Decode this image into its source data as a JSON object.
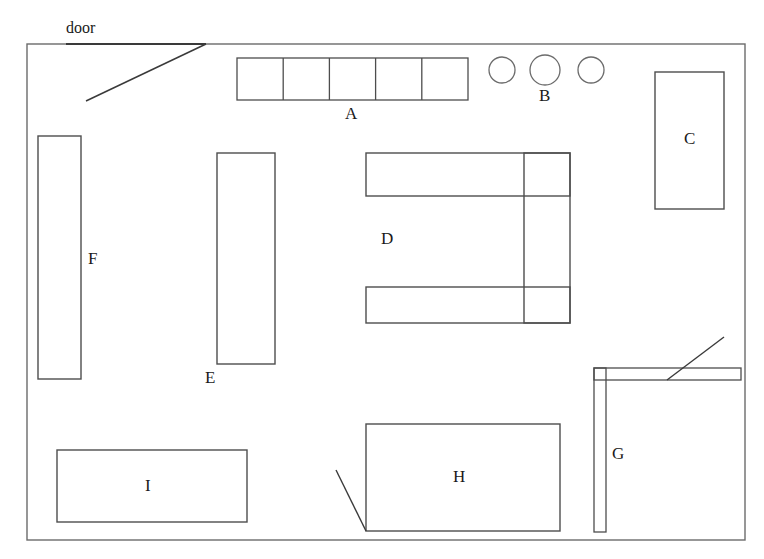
{
  "diagram": {
    "kind": "floor-plan",
    "title_text": "door",
    "stroke_color": "#4d4d4d",
    "wall_color": "#6b6b6b",
    "door_stroke_color": "#3a3a3a",
    "background_color": "#ffffff",
    "label_color": "#1a1a1a",
    "canvas": {
      "width": 764,
      "height": 559
    }
  },
  "room": {
    "name": "outer-wall",
    "x": 27,
    "y": 44,
    "width": 718,
    "height": 496
  },
  "door_opening": {
    "label": "door",
    "label_x": 66,
    "label_y": 20,
    "wall_y": 44,
    "x1": 66,
    "x2": 206,
    "swing": {
      "x1": 86,
      "y1": 101,
      "x2": 206,
      "y2": 44
    }
  },
  "items": [
    {
      "id": "A",
      "label": "A",
      "shape": "segmented-row",
      "x": 237,
      "y": 58,
      "width": 231,
      "height": 42,
      "segments": 5,
      "label_x": 351,
      "label_y": 107,
      "label_position": "below"
    },
    {
      "id": "B",
      "label": "B",
      "shape": "circle-group",
      "label_x": 545,
      "label_y": 89,
      "label_position": "below",
      "circles": [
        {
          "cx": 502,
          "cy": 70,
          "r": 13
        },
        {
          "cx": 545,
          "cy": 70,
          "r": 15
        },
        {
          "cx": 591,
          "cy": 70,
          "r": 13
        }
      ]
    },
    {
      "id": "C",
      "label": "C",
      "shape": "rect",
      "x": 655,
      "y": 72,
      "width": 69,
      "height": 137,
      "label_x": 690,
      "label_y": 132,
      "label_position": "inside"
    },
    {
      "id": "D",
      "label": "D",
      "shape": "u-desk",
      "x": 366,
      "y": 153,
      "width": 204,
      "height": 170,
      "arm_thickness": 43,
      "bottom_arm_thickness": 36,
      "right_divider_x": 524,
      "label_x": 384,
      "label_y": 232,
      "label_position": "inside-left"
    },
    {
      "id": "E",
      "label": "E",
      "shape": "rect",
      "x": 217,
      "y": 153,
      "width": 58,
      "height": 211,
      "label_x": 206,
      "label_y": 371,
      "label_position": "below-left"
    },
    {
      "id": "F",
      "label": "F",
      "shape": "rect",
      "x": 38,
      "y": 136,
      "width": 43,
      "height": 243,
      "label_x": 88,
      "label_y": 252,
      "label_position": "right"
    },
    {
      "id": "G",
      "label": "G",
      "shape": "l-partition",
      "vertical": {
        "x": 594,
        "y": 368,
        "width": 12,
        "height": 164
      },
      "horizontal": {
        "x": 594,
        "y": 368,
        "width": 147,
        "height": 12
      },
      "swing": {
        "x1": 667,
        "y1": 380,
        "x2": 724,
        "y2": 337
      },
      "label_x": 612,
      "label_y": 448,
      "label_position": "right-of-vertical"
    },
    {
      "id": "H",
      "label": "H",
      "shape": "rect",
      "x": 366,
      "y": 424,
      "width": 194,
      "height": 107,
      "swing": {
        "x1": 336,
        "y1": 470,
        "x2": 366,
        "y2": 531
      },
      "label_x": 458,
      "label_y": 470,
      "label_position": "inside"
    },
    {
      "id": "I",
      "label": "I",
      "shape": "rect",
      "x": 57,
      "y": 450,
      "width": 190,
      "height": 72,
      "label_x": 148,
      "label_y": 479,
      "label_position": "inside"
    }
  ]
}
